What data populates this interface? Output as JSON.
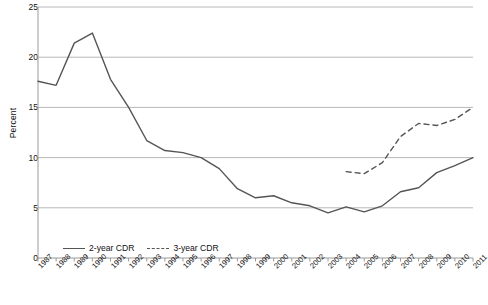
{
  "chart_data": {
    "type": "line",
    "title": "",
    "xlabel": "",
    "ylabel": "Percent",
    "ylim": [
      0,
      25
    ],
    "yticks": [
      0,
      5,
      10,
      15,
      20,
      25
    ],
    "grid": true,
    "legend_position": "inside-bottom-left",
    "categories": [
      "1987",
      "1988",
      "1989",
      "1990",
      "1991",
      "1992",
      "1993",
      "1994",
      "1995",
      "1996",
      "1997",
      "1998",
      "1999",
      "2000",
      "2001",
      "2002",
      "2003",
      "2004",
      "2005",
      "2006",
      "2007",
      "2008",
      "2009",
      "2010",
      "2011"
    ],
    "series": [
      {
        "name": "2-year CDR",
        "style": "solid",
        "color": "#555555",
        "values": [
          17.6,
          17.2,
          21.4,
          22.4,
          17.8,
          15.0,
          11.7,
          10.7,
          10.5,
          10.0,
          8.9,
          6.9,
          6.0,
          6.2,
          5.5,
          5.2,
          4.5,
          5.1,
          4.6,
          5.2,
          6.6,
          7.0,
          8.5,
          9.2,
          10.0
        ]
      },
      {
        "name": "3-year CDR",
        "style": "dashed",
        "color": "#555555",
        "values": [
          null,
          null,
          null,
          null,
          null,
          null,
          null,
          null,
          null,
          null,
          null,
          null,
          null,
          null,
          null,
          null,
          null,
          8.6,
          8.4,
          9.5,
          12.1,
          13.4,
          13.2,
          13.8,
          15.0
        ]
      }
    ]
  },
  "axis": {
    "y_label": "Percent",
    "y_tick_labels": [
      "0",
      "5",
      "10",
      "15",
      "20",
      "25"
    ],
    "x_tick_labels": [
      "1987",
      "1988",
      "1989",
      "1990",
      "1991",
      "1992",
      "1993",
      "1994",
      "1995",
      "1996",
      "1997",
      "1998",
      "1999",
      "2000",
      "2001",
      "2002",
      "2003",
      "2004",
      "2005",
      "2006",
      "2007",
      "2008",
      "2009",
      "2010",
      "2011"
    ]
  },
  "legend": {
    "items": [
      {
        "label": "2-year CDR",
        "style": "solid"
      },
      {
        "label": "3-year CDR",
        "style": "dashed"
      }
    ]
  },
  "footer": {
    "text": ""
  },
  "colors": {
    "line": "#555555",
    "grid": "#b8b8b8",
    "axis": "#9a9a9a",
    "text": "#111111"
  }
}
